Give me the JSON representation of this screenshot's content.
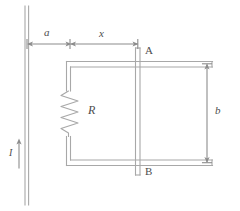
{
  "figure": {
    "colors": {
      "line": "#a8a8a8",
      "line_dark": "#8c8c8c",
      "label": "#4d4d4d",
      "background": "#ffffff"
    },
    "labels": {
      "distance_a": "a",
      "distance_x": "x",
      "terminal_top": "A",
      "terminal_bottom": "B",
      "resistor": "R",
      "rail_separation": "b",
      "current": "I"
    },
    "elements": {
      "wire_name": "long-straight-wire",
      "rail_top_name": "top-rail",
      "rail_bottom_name": "bottom-rail",
      "bar_name": "sliding-bar-AB",
      "resistor_name": "resistor-R",
      "dim_a_name": "dimension-a",
      "dim_x_name": "dimension-x",
      "dim_b_name": "dimension-b",
      "current_arrow_name": "current-arrow-I"
    }
  }
}
